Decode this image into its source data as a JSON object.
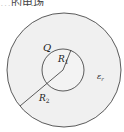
{
  "caption_fragment": "…的电场",
  "diagram": {
    "type": "concentric-spheres-cross-section",
    "charge_label": "Q",
    "inner_radius_label": "R",
    "inner_radius_sub": "1",
    "outer_radius_label": "R",
    "outer_radius_sub": "2",
    "medium_label": "ε",
    "medium_sub": "r",
    "colors": {
      "outer_fill": "#f0f0f0",
      "inner_fill": "#f4f4f4",
      "stroke": "#333333",
      "background": "#ffffff"
    }
  }
}
